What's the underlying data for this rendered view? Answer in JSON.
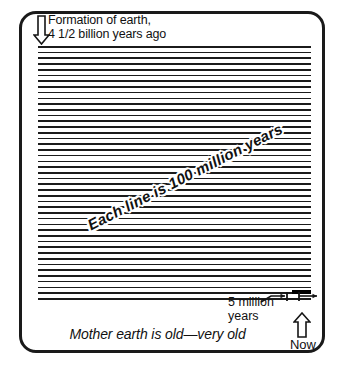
{
  "figure": {
    "header_caption": "Formation of earth,\n4 1/2 billion years ago",
    "diagonal_label": "Each line is 100 million years",
    "five_million_label": "5 million\nyears",
    "now_label": "Now",
    "tagline": "Mother earth is old—very old"
  },
  "chart_data": {
    "type": "bar",
    "title": "Mother earth is old—very old",
    "subtitle": "Formation of earth, 4 1/2 billion years ago",
    "xlabel": "",
    "ylabel": "Geologic time",
    "annotations": [
      "Formation of earth, 4 1/2 billion years ago",
      "Each line is 100 million years",
      "5 million years",
      "Now",
      "Mother earth is old—very old"
    ],
    "unit_per_line_million_years": 100,
    "total_age_billion_years": 4.5,
    "line_count": 45,
    "categories": [
      "line 1",
      "line 2",
      "line 3",
      "line 4",
      "line 5",
      "line 6",
      "line 7",
      "line 8",
      "line 9",
      "line 10",
      "line 11",
      "line 12",
      "line 13",
      "line 14",
      "line 15",
      "line 16",
      "line 17",
      "line 18",
      "line 19",
      "line 20",
      "line 21",
      "line 22",
      "line 23",
      "line 24",
      "line 25",
      "line 26",
      "line 27",
      "line 28",
      "line 29",
      "line 30",
      "line 31",
      "line 32",
      "line 33",
      "line 34",
      "line 35",
      "line 36",
      "line 37",
      "line 38",
      "line 39",
      "line 40",
      "line 41",
      "line 42",
      "line 43",
      "line 44",
      "line 45"
    ],
    "values": [
      100,
      100,
      100,
      100,
      100,
      100,
      100,
      100,
      100,
      100,
      100,
      100,
      100,
      100,
      100,
      100,
      100,
      100,
      100,
      100,
      100,
      100,
      100,
      100,
      100,
      100,
      100,
      100,
      100,
      100,
      100,
      100,
      100,
      100,
      100,
      100,
      100,
      100,
      100,
      100,
      100,
      100,
      100,
      100,
      100
    ],
    "highlight": {
      "label": "5 million years",
      "value": 5,
      "position": "end of last line",
      "color": "#000000"
    },
    "grid": false,
    "legend": "none"
  },
  "style": {
    "ink": "#1a1a1a",
    "paper": "#ffffff",
    "highlight": "#000000"
  }
}
